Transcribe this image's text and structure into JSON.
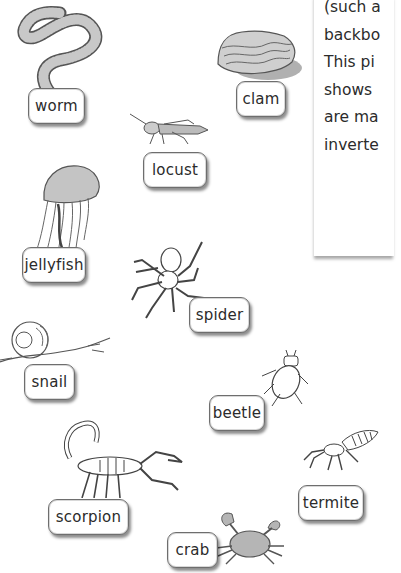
{
  "panel": {
    "lines": [
      "(such a",
      "backbo",
      "This pi",
      "shows",
      "are ma",
      "inverte"
    ]
  },
  "labels": {
    "worm": "worm",
    "clam": "clam",
    "locust": "locust",
    "jellyfish": "jellyfish",
    "spider": "spider",
    "snail": "snail",
    "beetle": "beetle",
    "termite": "termite",
    "scorpion": "scorpion",
    "crab": "crab"
  },
  "colors": {
    "label_border": "#6e6e6e",
    "text": "#2b2b2b",
    "illustration_stroke": "#555555",
    "illustration_fill": "#bdbdbd"
  }
}
